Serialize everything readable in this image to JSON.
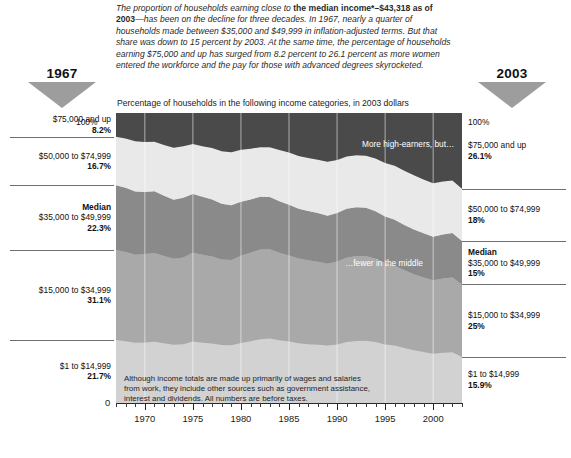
{
  "intro": {
    "part1": "The proportion of households earning close to ",
    "bold": "the median income*–$43,318 as of 2003",
    "part2": "—has been on the decline for three decades. In 1967, nearly a quarter of households made between $35,000 and $49,999 in inflation-adjusted terms. But that share was down to 15 percent by 2003. At the same time, the percentage of households earning $75,000 and up has surged from 8.2 percent to 26.1 percent as more women entered the workforce and the pay for those with advanced degrees skyrocketed."
  },
  "year_left": {
    "label": "1967",
    "marker": "triangle-down-icon"
  },
  "year_right": {
    "label": "2003",
    "marker": "triangle-down-icon"
  },
  "subtitle": "Percentage of households in the following income categories, in 2003 dollars",
  "axis_top_label_left": "100%",
  "axis_top_label_right": "100%",
  "axis_zero_label": "0",
  "annotations": {
    "high": "More high-earners, but…",
    "middle": "…fewer in the middle"
  },
  "plot_note": "Although income totals are made up primarily of wages and salaries from work, they include other sources such as government assistance, interest and dividends. All numbers are before taxes.",
  "left_labels": [
    {
      "name": "$75,000 and up",
      "pct": "8.2%",
      "median": false
    },
    {
      "name": "$50,000 to $74,999",
      "pct": "16.7%",
      "median": false
    },
    {
      "name": "$35,000 to $49,999",
      "pct": "22.3%",
      "median": true,
      "median_label": "Median"
    },
    {
      "name": "$15,000 to $34,999",
      "pct": "31.1%",
      "median": false
    },
    {
      "name": "$1 to $14,999",
      "pct": "21.7%",
      "median": false
    }
  ],
  "right_labels": [
    {
      "name": "$75,000 and up",
      "pct": "26.1%",
      "median": false
    },
    {
      "name": "$50,000 to $74,999",
      "pct": "18%",
      "median": false
    },
    {
      "name": "$35,000 to $49,999",
      "pct": "15%",
      "median": true,
      "median_label": "Median"
    },
    {
      "name": "$15,000 to $34,999",
      "pct": "25%",
      "median": false
    },
    {
      "name": "$1 to $14,999",
      "pct": "15.9%",
      "median": false
    }
  ],
  "colors": {
    "band_75_up": "#4a4a4a",
    "band_50_74": "#e9e9e9",
    "band_35_49": "#8a8a8a",
    "band_15_34": "#a9a9a9",
    "band_1_14": "#d2d2d2",
    "marker": "#9d9d9d"
  },
  "chart_data": {
    "type": "area",
    "title": "Percentage of households in the following income categories, in 2003 dollars",
    "xlabel": "",
    "ylabel": "",
    "xlim": [
      1967,
      2003
    ],
    "ylim": [
      0,
      100
    ],
    "grid": true,
    "stacked": true,
    "legend": "side-labels",
    "tick_labels": [
      "1970",
      "1975",
      "1980",
      "1985",
      "1990",
      "1995",
      "2000"
    ],
    "tick_values": [
      1970,
      1975,
      1980,
      1985,
      1990,
      1995,
      2000
    ],
    "x": [
      1967,
      1968,
      1969,
      1970,
      1971,
      1972,
      1973,
      1974,
      1975,
      1976,
      1977,
      1978,
      1979,
      1980,
      1981,
      1982,
      1983,
      1984,
      1985,
      1986,
      1987,
      1988,
      1989,
      1990,
      1991,
      1992,
      1993,
      1994,
      1995,
      1996,
      1997,
      1998,
      1999,
      2000,
      2001,
      2002,
      2003
    ],
    "series": [
      {
        "name": "$1 to $14,999",
        "color": "#d2d2d2",
        "values": [
          21.7,
          21.3,
          20.8,
          20.9,
          21.1,
          20.6,
          20.1,
          20.3,
          21.2,
          20.8,
          20.5,
          20.0,
          19.9,
          20.7,
          21.3,
          22.0,
          22.2,
          21.6,
          21.2,
          20.6,
          20.3,
          20.1,
          19.8,
          20.2,
          21.0,
          21.4,
          21.5,
          21.0,
          20.2,
          19.8,
          19.0,
          18.2,
          17.6,
          17.0,
          17.3,
          17.5,
          15.9
        ]
      },
      {
        "name": "$15,000 to $34,999",
        "color": "#a9a9a9",
        "values": [
          31.1,
          30.8,
          30.3,
          30.5,
          30.6,
          30.1,
          29.6,
          29.9,
          30.6,
          30.3,
          30.0,
          29.5,
          29.4,
          30.1,
          30.5,
          30.9,
          30.8,
          30.2,
          29.7,
          29.2,
          28.9,
          28.6,
          28.2,
          28.6,
          29.1,
          29.3,
          29.2,
          28.7,
          28.0,
          27.5,
          26.8,
          26.2,
          25.7,
          25.3,
          25.6,
          25.8,
          25.0
        ]
      },
      {
        "name": "$35,000 to $49,999",
        "color": "#8a8a8a",
        "values": [
          22.3,
          22.1,
          21.8,
          21.4,
          21.3,
          20.8,
          20.4,
          20.6,
          20.3,
          20.0,
          19.7,
          19.2,
          18.9,
          18.6,
          18.4,
          18.2,
          18.0,
          17.8,
          17.5,
          17.2,
          17.0,
          16.8,
          16.6,
          16.7,
          16.9,
          16.8,
          16.6,
          16.4,
          16.1,
          15.9,
          15.6,
          15.4,
          15.2,
          15.0,
          15.2,
          15.3,
          15.0
        ]
      },
      {
        "name": "$50,000 to $74,999",
        "color": "#e9e9e9",
        "values": [
          16.7,
          17.0,
          17.4,
          17.2,
          17.1,
          17.5,
          17.9,
          17.7,
          17.2,
          17.4,
          17.7,
          18.1,
          18.3,
          17.9,
          17.5,
          17.1,
          17.2,
          17.6,
          18.0,
          18.2,
          18.3,
          18.4,
          18.6,
          18.3,
          18.0,
          17.9,
          18.0,
          18.2,
          18.5,
          18.6,
          18.7,
          18.7,
          18.6,
          18.5,
          18.3,
          18.1,
          18.0
        ]
      },
      {
        "name": "$75,000 and up",
        "color": "#4a4a4a",
        "values": [
          8.2,
          8.8,
          9.7,
          10.0,
          9.9,
          11.0,
          12.0,
          11.5,
          10.7,
          11.5,
          12.1,
          13.2,
          13.5,
          12.7,
          12.3,
          11.8,
          11.8,
          12.8,
          13.6,
          14.8,
          15.5,
          16.1,
          16.8,
          16.2,
          15.0,
          14.6,
          14.7,
          15.7,
          17.2,
          18.2,
          19.9,
          21.5,
          22.9,
          24.2,
          23.6,
          23.3,
          26.1
        ]
      }
    ]
  }
}
